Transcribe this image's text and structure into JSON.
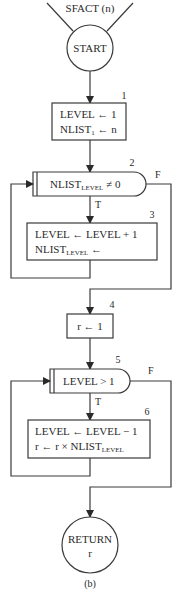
{
  "diagram": {
    "type": "flowchart",
    "entry_label": "SFACT (n)",
    "caption": "(b)",
    "nodes": {
      "start": {
        "label": "START"
      },
      "box1": {
        "number": "1",
        "line1": "LEVEL ← 1",
        "line2_main": "NLIST",
        "line2_sub": "1",
        "line2_rest": " ← n"
      },
      "dec2": {
        "number": "2",
        "main": "NLIST",
        "sub": "LEVEL",
        "rest": " ≠ 0",
        "true_label": "T",
        "false_label": "F"
      },
      "box3": {
        "number": "3",
        "line1": "LEVEL ← LEVEL + 1",
        "line2_main": "NLIST",
        "line2_sub": "LEVEL",
        "line2_rest": " ←"
      },
      "box4": {
        "number": "4",
        "line1": "r ← 1"
      },
      "dec5": {
        "number": "5",
        "label": "LEVEL > 1",
        "true_label": "T",
        "false_label": "F"
      },
      "box6": {
        "number": "6",
        "line1": "LEVEL ← LEVEL − 1",
        "line2_main": "r ← r × NLIST",
        "line2_sub": "LEVEL"
      },
      "end": {
        "line1": "RETURN",
        "line2": "r"
      }
    }
  }
}
